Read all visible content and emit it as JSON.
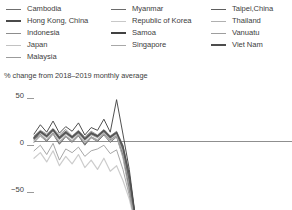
{
  "legend": {
    "columns": [
      {
        "items": [
          {
            "label": "Cambodia",
            "color": "#6f6f6f",
            "width": 1.6
          },
          {
            "label": "Hong Kong, China",
            "color": "#4a4a4a",
            "width": 2.0
          },
          {
            "label": "Indonesia",
            "color": "#8d8d8d",
            "width": 1.4
          },
          {
            "label": "Japan",
            "color": "#c2c2c2",
            "width": 1.3
          },
          {
            "label": "Malaysia",
            "color": "#9b9b9b",
            "width": 1.5
          }
        ]
      },
      {
        "items": [
          {
            "label": "Myanmar",
            "color": "#6b6b6b",
            "width": 1.6
          },
          {
            "label": "Republic of Korea",
            "color": "#c8c8c8",
            "width": 1.3
          },
          {
            "label": "Samoa",
            "color": "#414141",
            "width": 2.3
          },
          {
            "label": "Singapore",
            "color": "#a8a8a8",
            "width": 1.4
          }
        ]
      },
      {
        "items": [
          {
            "label": "Taipei,China",
            "color": "#5e5e5e",
            "width": 1.7
          },
          {
            "label": "Thailand",
            "color": "#b0b0b0",
            "width": 1.4
          },
          {
            "label": "Vanuatu",
            "color": "#9e9e9e",
            "width": 1.5
          },
          {
            "label": "Viet Nam",
            "color": "#4d4d4d",
            "width": 2.0
          }
        ]
      }
    ]
  },
  "subtitle": "% change from 2018–2019  monthly average",
  "axis": {
    "y_ticks": [
      "50",
      "0",
      "−50"
    ]
  },
  "chart_data": {
    "type": "line",
    "title": "",
    "subtitle": "% change from 2018–2019  monthly average",
    "xlabel": "",
    "ylabel": "% change from 2018–2019 monthly average",
    "ylim": [
      -95,
      60
    ],
    "y_ticks": [
      50,
      0,
      -50
    ],
    "grid": false,
    "zero_line": true,
    "legend_position": "top",
    "x": [
      1,
      2,
      3,
      4,
      5,
      6,
      7,
      8,
      9,
      10,
      11,
      12,
      13,
      14,
      15,
      16,
      17,
      18
    ],
    "series": [
      {
        "name": "Cambodia",
        "color": "#6f6f6f",
        "values": [
          4,
          10,
          6,
          13,
          5,
          11,
          4,
          9,
          3,
          10,
          6,
          12,
          5,
          9,
          -6,
          -38,
          -86,
          -94
        ]
      },
      {
        "name": "Hong Kong, China",
        "color": "#4a4a4a",
        "values": [
          2,
          8,
          1,
          9,
          -2,
          6,
          0,
          7,
          -3,
          5,
          1,
          8,
          2,
          6,
          -14,
          -52,
          -92,
          -96
        ]
      },
      {
        "name": "Indonesia",
        "color": "#8d8d8d",
        "values": [
          6,
          12,
          8,
          14,
          7,
          13,
          6,
          12,
          5,
          11,
          7,
          13,
          6,
          11,
          -4,
          -35,
          -84,
          -93
        ]
      },
      {
        "name": "Japan",
        "color": "#c2c2c2",
        "values": [
          3,
          9,
          4,
          11,
          2,
          8,
          3,
          10,
          1,
          7,
          4,
          10,
          3,
          8,
          -10,
          -44,
          -88,
          -95
        ]
      },
      {
        "name": "Malaysia",
        "color": "#9b9b9b",
        "values": [
          5,
          11,
          7,
          12,
          4,
          10,
          5,
          11,
          4,
          9,
          5,
          11,
          4,
          10,
          -7,
          -40,
          -85,
          -94
        ]
      },
      {
        "name": "Myanmar",
        "color": "#6b6b6b",
        "values": [
          -1,
          6,
          0,
          8,
          -3,
          5,
          -1,
          6,
          -4,
          4,
          0,
          7,
          -1,
          5,
          -16,
          -50,
          -89,
          -95
        ]
      },
      {
        "name": "Republic of Korea",
        "color": "#c8c8c8",
        "values": [
          -18,
          -12,
          -22,
          -10,
          -26,
          -16,
          -24,
          -14,
          -28,
          -20,
          -30,
          -18,
          -32,
          -26,
          -42,
          -62,
          -90,
          -96
        ]
      },
      {
        "name": "Samoa",
        "color": "#414141",
        "values": [
          8,
          18,
          10,
          22,
          9,
          16,
          11,
          20,
          7,
          15,
          12,
          24,
          10,
          45,
          8,
          -30,
          -83,
          -94
        ]
      },
      {
        "name": "Singapore",
        "color": "#a8a8a8",
        "values": [
          1,
          7,
          2,
          9,
          0,
          6,
          1,
          8,
          -1,
          5,
          2,
          9,
          1,
          7,
          -12,
          -46,
          -87,
          -95
        ]
      },
      {
        "name": "Taipei,China",
        "color": "#5e5e5e",
        "values": [
          3,
          10,
          5,
          12,
          3,
          9,
          4,
          10,
          2,
          8,
          5,
          11,
          4,
          9,
          -8,
          -42,
          -86,
          -94
        ]
      },
      {
        "name": "Thailand",
        "color": "#b0b0b0",
        "values": [
          0,
          6,
          1,
          8,
          -1,
          5,
          0,
          7,
          -2,
          4,
          1,
          8,
          0,
          6,
          -18,
          -55,
          -91,
          -96
        ]
      },
      {
        "name": "Vanuatu",
        "color": "#9e9e9e",
        "values": [
          -10,
          -4,
          -14,
          -2,
          -20,
          -8,
          -12,
          -6,
          -16,
          -10,
          -8,
          -4,
          -13,
          -9,
          -30,
          -58,
          -88,
          -95
        ]
      },
      {
        "name": "Viet Nam",
        "color": "#4d4d4d",
        "values": [
          4,
          11,
          6,
          13,
          4,
          10,
          5,
          11,
          3,
          9,
          6,
          12,
          5,
          10,
          -5,
          -36,
          -84,
          -93
        ]
      }
    ]
  }
}
